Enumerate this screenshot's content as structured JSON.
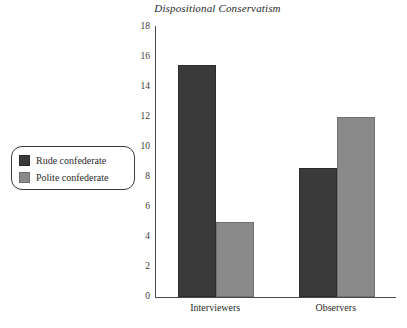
{
  "chart_data": {
    "type": "bar",
    "title": "Dispositional Conservatism",
    "xlabel": "",
    "ylabel": "",
    "categories": [
      "Interviewers",
      "Observers"
    ],
    "series": [
      {
        "name": "Rude confederate",
        "color": "#3a3a3a",
        "values": [
          15.5,
          8.6
        ]
      },
      {
        "name": "Polite confederate",
        "color": "#8a8a8a",
        "values": [
          5.0,
          12.0
        ]
      }
    ],
    "ylim": [
      0,
      18
    ],
    "ytick_step": 2,
    "yticks": [
      "18",
      "16",
      "14",
      "12",
      "10",
      "8",
      "6",
      "4",
      "2",
      "0"
    ],
    "grid": false,
    "legend_position": "left-outside"
  },
  "legend": {
    "items": [
      {
        "label": "Rude confederate",
        "swatch": "dark"
      },
      {
        "label": "Polite confederate",
        "swatch": "light"
      }
    ]
  }
}
